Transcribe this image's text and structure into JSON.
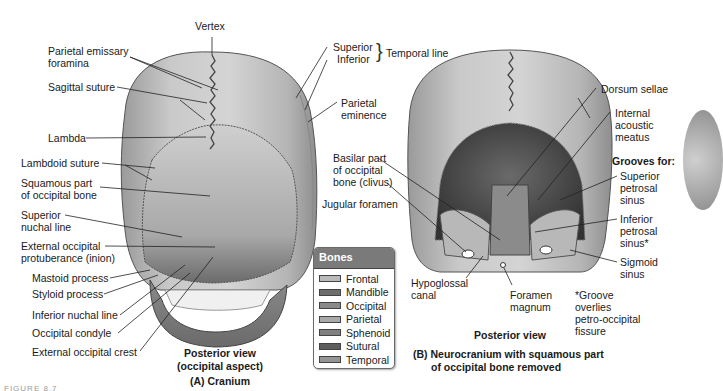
{
  "figure_a": {
    "labels": {
      "vertex": "Vertex",
      "parietal_emissary_1": "Parietal emissary",
      "parietal_emissary_2": "foramina",
      "sagittal_suture": "Sagittal suture",
      "lambda": "Lambda",
      "lambdoid_suture": "Lambdoid suture",
      "squamous_1": "Squamous part",
      "squamous_2": "of occipital bone",
      "superior_nuchal_1": "Superior",
      "superior_nuchal_2": "nuchal line",
      "ext_occ_prot_1": "External occipital",
      "ext_occ_prot_2": "protuberance (inion)",
      "mastoid": "Mastoid process",
      "styloid": "Styloid process",
      "inferior_nuchal": "Inferior nuchal line",
      "occipital_condyle": "Occipital condyle",
      "ext_occ_crest": "External occipital crest",
      "temporal_superior": "Superior",
      "temporal_inferior": "Inferior",
      "temporal_line": "Temporal line",
      "parietal_eminence_1": "Parietal",
      "parietal_eminence_2": "eminence"
    },
    "caption_view_1": "Posterior view",
    "caption_view_2": "(occipital aspect)",
    "caption_title": "(A) Cranium"
  },
  "figure_b": {
    "labels": {
      "basilar_1": "Basilar part",
      "basilar_2": "of occipital",
      "basilar_3": "bone (clivus)",
      "jugular_foramen": "Jugular foramen",
      "hypoglossal_1": "Hypoglossal",
      "hypoglossal_2": "canal",
      "foramen_magnum_1": "Foramen",
      "foramen_magnum_2": "magnum",
      "dorsum_sellae": "Dorsum sellae",
      "iam_1": "Internal",
      "iam_2": "acoustic",
      "iam_3": "meatus",
      "grooves_for": "Grooves for:",
      "sps_1": "Superior",
      "sps_2": "petrosal",
      "sps_3": "sinus",
      "ips_1": "Inferior",
      "ips_2": "petrosal",
      "ips_3": "sinus*",
      "sigmoid_1": "Sigmoid",
      "sigmoid_2": "sinus",
      "note_1": "*Groove",
      "note_2": "overlies",
      "note_3": "petro-occipital",
      "note_4": "fissure"
    },
    "caption_view": "Posterior view",
    "caption_title_1": "(B) Neurocranium with squamous part",
    "caption_title_2": "of occipital bone removed"
  },
  "legend": {
    "title": "Bones",
    "header_color": "#7a7a7a",
    "items": [
      {
        "label": "Frontal",
        "color": "#b9b9b9"
      },
      {
        "label": "Mandible",
        "color": "#6e6e6e"
      },
      {
        "label": "Occipital",
        "color": "#8a8a8a"
      },
      {
        "label": "Parietal",
        "color": "#a9a9a9"
      },
      {
        "label": "Sphenoid",
        "color": "#808080"
      },
      {
        "label": "Sutural",
        "color": "#5e5e5e"
      },
      {
        "label": "Temporal",
        "color": "#959595"
      }
    ]
  },
  "figure_number": "FIGURE 8.7"
}
